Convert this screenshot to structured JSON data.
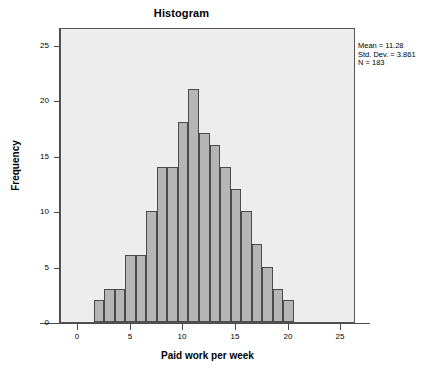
{
  "chart_data": {
    "type": "bar",
    "title": "Histogram",
    "xlabel": "Paid work per week",
    "ylabel": "Frequency",
    "xlim": [
      -1.6,
      26.4
    ],
    "ylim": [
      0,
      26.6
    ],
    "grid": false,
    "legend": null,
    "bin_width": 1,
    "bin_starts": [
      1.5,
      2.5,
      3.5,
      4.5,
      5.5,
      6.5,
      7.5,
      8.5,
      9.5,
      10.5,
      11.5,
      12.5,
      13.5,
      14.5,
      15.5,
      16.5,
      17.5,
      18.5,
      19.5
    ],
    "bin_centers": [
      2,
      3,
      4,
      5,
      6,
      7,
      8,
      9,
      10,
      11,
      12,
      13,
      14,
      15,
      16,
      17,
      18,
      19,
      20
    ],
    "categories": [
      "2",
      "3",
      "4",
      "5",
      "6",
      "7",
      "8",
      "9",
      "10",
      "11",
      "12",
      "13",
      "14",
      "15",
      "16",
      "17",
      "18",
      "19",
      "20"
    ],
    "values": [
      2,
      3,
      3,
      6,
      6,
      10,
      14,
      14,
      18,
      21,
      17,
      16,
      14,
      12,
      10,
      7,
      5,
      3,
      2
    ],
    "x_ticks": [
      0,
      5,
      10,
      15,
      20,
      25
    ],
    "x_tick_labels": [
      "0",
      "5",
      "10",
      "15",
      "20",
      "25"
    ],
    "y_ticks": [
      0,
      5,
      10,
      15,
      20,
      25
    ],
    "y_tick_labels": [
      "0",
      "5",
      "10",
      "15",
      "20",
      "25"
    ],
    "annotations": [
      "Mean = 11.28",
      "Std. Dev. = 3.861",
      "N = 183"
    ],
    "bar_fill_color": "#b5b5b5",
    "bar_edge_color": "#4a4a4a",
    "plot_background_color": "#ededed",
    "figure_background_color": "#ffffff"
  },
  "stats": {
    "mean_line": "Mean = 11.28",
    "std_dev_line": "Std. Dev. = 3.861",
    "n_line": "N = 183"
  }
}
